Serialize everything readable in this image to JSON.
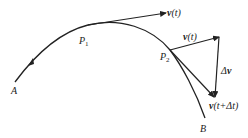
{
  "diagram": {
    "points": {
      "A": {
        "label": "A"
      },
      "P1": {
        "label": "P",
        "sub": "1"
      },
      "P2": {
        "label": "P",
        "sub": "2"
      },
      "B": {
        "label": "B"
      }
    },
    "vectors": {
      "v_at_P1": {
        "bold": "v",
        "rest": "(t)"
      },
      "v_at_P2": {
        "bold": "v",
        "rest": "(t)"
      },
      "delta_v": {
        "prefix": "Δ",
        "bold": "v"
      },
      "v_next": {
        "bold": "v",
        "rest": "(t+Δt)"
      }
    },
    "colors": {
      "stroke": "#222222",
      "background": "#ffffff"
    }
  }
}
